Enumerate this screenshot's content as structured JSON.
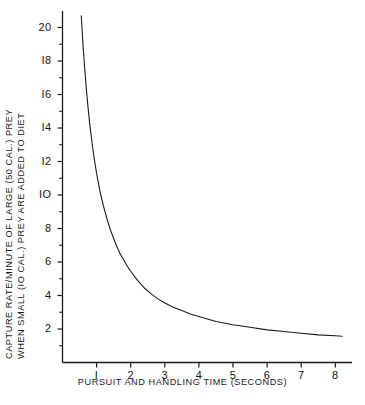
{
  "chart_data": {
    "type": "line",
    "title": "",
    "xlabel": "PURSUIT AND HANDLING TIME (SECONDS)",
    "ylabel": "CAPTURE RATE/MINUTE OF LARGE (50 CAL.) PREY WHEN SMALL (10 CAL.) PREY ARE ADDED TO DIET",
    "ylabel_line1": "CAPTURE RATE/MINUTE OF LARGE (50 CAL.) PREY",
    "ylabel_line2": "WHEN SMALL (IO CAL.) PREY ARE ADDED TO DIET",
    "xlim": [
      0,
      8.6
    ],
    "ylim": [
      0,
      21.4
    ],
    "xticks": [
      1,
      2,
      3,
      4,
      5,
      6,
      7,
      8
    ],
    "xtick_labels": [
      "I",
      "2",
      "3",
      "4",
      "5",
      "6",
      "7",
      "8"
    ],
    "yticks": [
      2,
      4,
      6,
      8,
      10,
      12,
      14,
      16,
      18,
      20
    ],
    "ytick_labels": [
      "2",
      "4",
      "6",
      "8",
      "IO",
      "I2",
      "I4",
      "I6",
      "I8",
      "20"
    ],
    "yticks_minor": [
      1,
      3,
      5,
      7,
      9,
      11,
      13,
      15,
      17,
      19,
      21
    ],
    "grid": false,
    "legend": null,
    "line_color": "#1a1a1a",
    "line_width": 1.1,
    "background": "#ffffff",
    "series": [
      {
        "name": "capture rate",
        "x": [
          0.55,
          0.6,
          0.65,
          0.7,
          0.75,
          0.8,
          0.85,
          0.9,
          0.95,
          1.0,
          1.1,
          1.2,
          1.3,
          1.4,
          1.5,
          1.6,
          1.7,
          1.8,
          1.9,
          2.0,
          2.2,
          2.4,
          2.6,
          2.8,
          3.0,
          3.25,
          3.5,
          3.75,
          4.0,
          4.5,
          5.0,
          5.5,
          6.0,
          6.5,
          7.0,
          7.5,
          8.0,
          8.2
        ],
        "y": [
          20.7,
          19.0,
          17.6,
          16.3,
          15.2,
          14.2,
          13.4,
          12.6,
          11.9,
          11.3,
          10.2,
          9.35,
          8.6,
          7.95,
          7.4,
          6.9,
          6.45,
          6.1,
          5.75,
          5.45,
          4.9,
          4.45,
          4.1,
          3.8,
          3.55,
          3.3,
          3.1,
          2.9,
          2.75,
          2.45,
          2.25,
          2.1,
          1.95,
          1.85,
          1.75,
          1.65,
          1.6,
          1.57
        ]
      }
    ]
  },
  "axes": {
    "x_axis_name": "x-axis",
    "y_axis_name": "y-axis"
  }
}
